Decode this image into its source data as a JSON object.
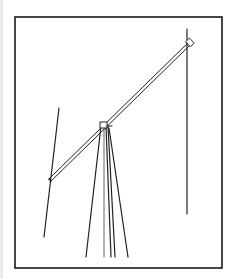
{
  "figure": {
    "colors": {
      "background": "#ffffff",
      "line": "#222222",
      "frame": "#1a1a1a"
    },
    "frame": {
      "x": 15,
      "y": 17,
      "width": 207,
      "height": 251
    },
    "boom": {
      "x1": 50,
      "y1": 180,
      "x2": 190,
      "y2": 43,
      "gap": 3
    },
    "right_pole": {
      "x": 187,
      "y1": 29,
      "y2": 214
    },
    "left_line": {
      "x1": 59,
      "y1": 108,
      "x2": 44,
      "y2": 237
    },
    "mast_apex": {
      "x": 103,
      "y": 125
    },
    "mast_legs": [
      {
        "x1": 101,
        "y1": 126,
        "x2": 86,
        "y2": 257
      },
      {
        "x1": 104,
        "y1": 126,
        "x2": 104,
        "y2": 257
      },
      {
        "x1": 106,
        "y1": 126,
        "x2": 111,
        "y2": 257
      },
      {
        "x1": 108,
        "y1": 126,
        "x2": 115,
        "y2": 257
      },
      {
        "x1": 109,
        "y1": 128,
        "x2": 128,
        "y2": 257
      }
    ]
  }
}
